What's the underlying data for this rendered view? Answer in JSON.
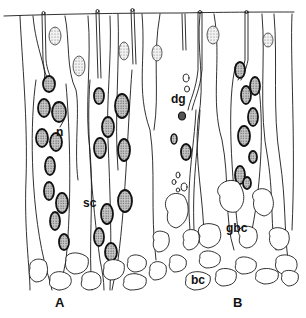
{
  "figure": {
    "labels": {
      "n": "n",
      "dg": "dg",
      "sc": "sc",
      "gbc": "gbc",
      "bc": "bc"
    },
    "panels": [
      "A",
      "B"
    ]
  }
}
